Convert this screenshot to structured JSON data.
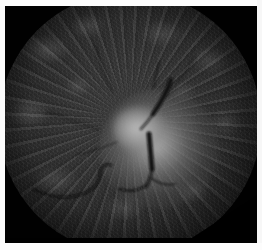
{
  "image": {
    "kind": "fundus-photograph",
    "modality_label": "Monochrome retinal fundus photograph",
    "subject_label": "Optic nerve head (optic disc)",
    "orientation_note": "Optic disc centred, slightly right of image centre",
    "color_mode": "grayscale",
    "width_px": 262,
    "height_px": 250
  },
  "frame": {
    "border_color": "#fbfbfb",
    "border_left_px": 5,
    "border_top_px": 6,
    "border_bottom_px": 7,
    "border_right_px": 5
  },
  "plate": {
    "background_color": "#010101",
    "left_px": 5,
    "top_px": 6,
    "width_px": 252,
    "height_px": 237
  },
  "retina_field": {
    "shape": "circle",
    "center_x_pct": 49,
    "center_y_pct": 48,
    "diameter_px": 262,
    "rim_color": "#020202",
    "mid_color": "#343434",
    "inner_color": "#3c3c3c"
  },
  "optic_disc": {
    "label": "optic-disc",
    "center_x_pct": 49,
    "center_y_pct": 49,
    "core_color": "#c0c0c0",
    "glow_color": "#b0b0b0",
    "halo_color": "#7a7a7a",
    "striation_label": "radial nerve fibre striations"
  },
  "vessels": {
    "color": "#0b0b0b",
    "items": [
      {
        "name": "superior-temporal-arcade",
        "description": "thick dark vessel descending from upper disc margin"
      },
      {
        "name": "central-retinal-vein-trunk",
        "description": "prominent vertical dark trunk below disc centre"
      },
      {
        "name": "inferior-nasal-branch",
        "description": "sinuous vessel curving to the lower left"
      },
      {
        "name": "inferior-temporal-branch",
        "description": "short branch arcing right below the disc"
      },
      {
        "name": "fine-branch-superior",
        "description": "faint thin vessel toward upper field"
      }
    ]
  },
  "mask": {
    "corner_cut_label": "bottom-right diagonal mask cut",
    "corner_color": "#000000"
  }
}
